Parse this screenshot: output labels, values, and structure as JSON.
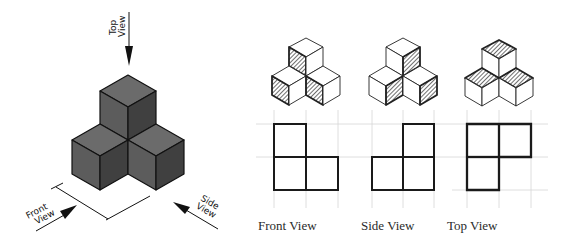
{
  "isometric": {
    "arrows": {
      "top": {
        "line1": "Top",
        "line2": "View"
      },
      "front": {
        "line1": "Front",
        "line2": "View"
      },
      "side": {
        "line1": "Side",
        "line2": "View"
      }
    },
    "colors": {
      "top_face": "#6b6b6b",
      "left_face": "#5a5a5a",
      "right_face": "#3f3f3f",
      "edge": "#111111"
    }
  },
  "views": [
    {
      "label": "Front View",
      "highlight": "left faces hatched",
      "grid_cells": [
        [
          1,
          0,
          0
        ],
        [
          1,
          1,
          0
        ]
      ]
    },
    {
      "label": "Side View",
      "highlight": "right faces hatched",
      "grid_cells": [
        [
          0,
          1
        ],
        [
          1,
          1
        ]
      ]
    },
    {
      "label": "Top View",
      "highlight": "top faces hatched",
      "grid_cells": [
        [
          1,
          1
        ],
        [
          1,
          0
        ]
      ]
    }
  ]
}
